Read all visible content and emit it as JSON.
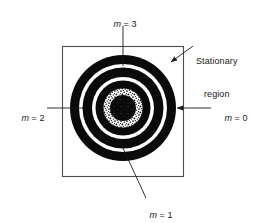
{
  "figure": {
    "background_color": "#ffffff",
    "ink_color": "#1a1a1a",
    "frame": {
      "name": "stationary-region-boundary",
      "x": 62,
      "y": 46,
      "width": 122,
      "height": 131,
      "stroke": "#4d4d4d",
      "stroke_width": 1.1,
      "fill": "none"
    },
    "center": {
      "x": 123,
      "y": 108
    }
  },
  "labels": {
    "m3": {
      "text_m": "m",
      "text_rest": " = 3",
      "full": "m = 3",
      "x": 103,
      "y": 14
    },
    "m2": {
      "text_m": "m",
      "text_rest": " = 2",
      "full": "m = 2",
      "x": 14,
      "y": 103
    },
    "m0": {
      "text_m": "m",
      "text_rest": " = 0",
      "full": "m = 0",
      "x": 214,
      "y": 103
    },
    "m1": {
      "text_m": "m",
      "text_rest": " = 1",
      "full": "m = 1",
      "x": 139,
      "y": 205
    },
    "stationary": {
      "line1": "Stationary",
      "line2": "region",
      "x": 196,
      "y": 40
    }
  },
  "rings": [
    {
      "name": "outer-black-ring",
      "r_outer": 53,
      "r_inner": 44,
      "fill": "#0a0a0a",
      "pattern": "solid"
    },
    {
      "name": "outer-white-gap",
      "r_outer": 44,
      "r_inner": 40.5,
      "fill": "#ffffff",
      "pattern": "solid"
    },
    {
      "name": "middle-black-ring",
      "r_outer": 40.5,
      "r_inner": 31,
      "fill": "#0a0a0a",
      "pattern": "solid"
    },
    {
      "name": "inner-white-gap",
      "r_outer": 31,
      "r_inner": 27.5,
      "fill": "#ffffff",
      "pattern": "solid"
    },
    {
      "name": "inner-black-ring",
      "r_outer": 27.5,
      "r_inner": 20,
      "fill": "#0a0a0a",
      "pattern": "solid"
    },
    {
      "name": "stippled-ring",
      "r_outer": 20,
      "r_inner": 13,
      "fill": "#ffffff",
      "pattern": "speckle"
    },
    {
      "name": "dark-core",
      "r_outer": 13,
      "r_inner": 0,
      "fill": "#0a0a0a",
      "pattern": "mottled"
    }
  ],
  "leaders": [
    {
      "name": "leader-m3",
      "x1": 123,
      "y1": 26,
      "x2": 123,
      "y2": 66,
      "arrow": false
    },
    {
      "name": "leader-m2",
      "x1": 47,
      "y1": 108,
      "x2": 85,
      "y2": 108,
      "arrow": false
    },
    {
      "name": "leader-m0",
      "x1": 211,
      "y1": 108,
      "x2": 175,
      "y2": 108,
      "arrow": true
    },
    {
      "name": "leader-m1",
      "x1": 146,
      "y1": 198,
      "x2": 122,
      "y2": 146,
      "arrow": false
    },
    {
      "name": "leader-stationary",
      "x1": 192,
      "y1": 47,
      "x2": 169,
      "y2": 63,
      "arrow": true
    }
  ]
}
